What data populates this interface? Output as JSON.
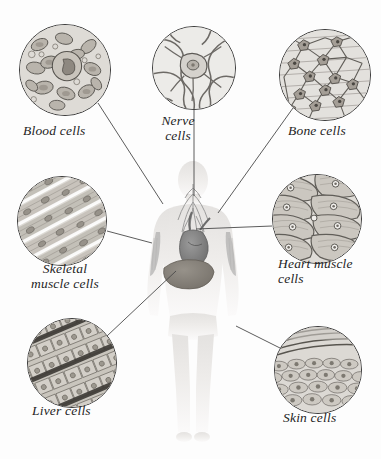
{
  "figure": {
    "style": "scientific illustration, translucent human figure with microscope-view insets"
  },
  "body_figure": {
    "name": "translucent-human-body",
    "organs_visible": [
      {
        "name": "nerves",
        "region": "head-and-neck",
        "color": "#8f8f8f"
      },
      {
        "name": "heart",
        "region": "chest-center",
        "color": "#8a8a8a"
      },
      {
        "name": "liver",
        "region": "upper-abdomen",
        "color": "#8c8880"
      },
      {
        "name": "skeletal-muscle",
        "region": "upper-arms",
        "color": "#a9a9a9"
      }
    ],
    "silhouette_color": "#eceae8"
  },
  "callouts": [
    {
      "id": "blood",
      "label": "Blood cells",
      "label_lines": "Blood cells",
      "circle": {
        "cx": 65,
        "cy": 70,
        "r": 46
      },
      "label_pos": {
        "x": 23,
        "y": 124
      },
      "leader": {
        "x1": 98,
        "y1": 103,
        "x2": 163,
        "y2": 204
      },
      "target_organ": "heart"
    },
    {
      "id": "nerve",
      "label": "Nerve cells",
      "label_lines": "Nerve\ncells",
      "circle": {
        "cx": 194,
        "cy": 68,
        "r": 42
      },
      "label_pos": {
        "x": 143,
        "y": 116
      },
      "leader": {
        "x1": 194,
        "y1": 110,
        "x2": 194,
        "y2": 195
      },
      "target_organ": "nerves"
    },
    {
      "id": "bone",
      "label": "Bone cells",
      "label_lines": "Bone cells",
      "circle": {
        "cx": 325,
        "cy": 75,
        "r": 46
      },
      "label_pos": {
        "x": 288,
        "y": 124
      },
      "leader": {
        "x1": 293,
        "y1": 108,
        "x2": 218,
        "y2": 213
      },
      "target_organ": "bone"
    },
    {
      "id": "skeletal-muscle",
      "label": "Skeletal muscle cells",
      "label_lines": "Skeletal\nmuscle cells",
      "circle": {
        "cx": 62,
        "cy": 221,
        "r": 45
      },
      "label_pos": {
        "x": 24,
        "y": 262
      },
      "leader": {
        "x1": 107,
        "y1": 231,
        "x2": 152,
        "y2": 243
      },
      "target_organ": "skeletal-muscle"
    },
    {
      "id": "heart-muscle",
      "label": "Heart muscle cells",
      "label_lines": "Heart muscle\ncells",
      "circle": {
        "cx": 317,
        "cy": 219,
        "r": 45
      },
      "label_pos": {
        "x": 278,
        "y": 259
      },
      "leader": {
        "x1": 272,
        "y1": 226,
        "x2": 196,
        "y2": 229
      },
      "target_organ": "heart"
    },
    {
      "id": "liver",
      "label": "Liver cells",
      "label_lines": "Liver cells",
      "circle": {
        "cx": 72,
        "cy": 363,
        "r": 45
      },
      "label_pos": {
        "x": 32,
        "y": 405
      },
      "leader": {
        "x1": 107,
        "y1": 336,
        "x2": 176,
        "y2": 271
      },
      "target_organ": "liver"
    },
    {
      "id": "skin",
      "label": "Skin cells",
      "label_lines": "Skin cells",
      "circle": {
        "cx": 318,
        "cy": 370,
        "r": 44
      },
      "label_pos": {
        "x": 283,
        "y": 412
      },
      "leader": {
        "x1": 280,
        "y1": 348,
        "x2": 236,
        "y2": 326
      },
      "target_organ": "skin"
    }
  ],
  "colors": {
    "ink": "#1d1d1d",
    "leader_line": "#4a4a4a",
    "circle_border": "#3a3a3a",
    "slide_bg": "#e9e7e4",
    "body_fill": "#eceae8"
  }
}
